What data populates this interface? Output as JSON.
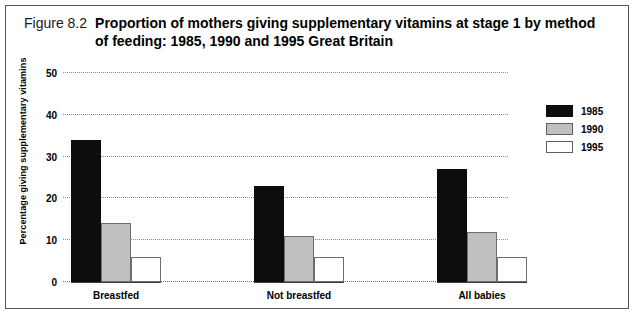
{
  "figure": {
    "number": "Figure 8.2",
    "title_line_1": "Proportion of mothers giving supplementary vitamins at stage 1 by method",
    "title_line_2": "of feeding: 1985, 1990 and 1995 Great Britain"
  },
  "colors": {
    "series_1985": "#0d0d0d",
    "series_1990": "#c0c0c0",
    "series_1995": "#ffffff",
    "gridline": "#8d8d8d",
    "axis": "#3d3d3d",
    "frame": "#555555"
  },
  "chart_data": {
    "type": "bar",
    "title": "Proportion of mothers giving supplementary vitamins at stage 1 by method of feeding: 1985, 1990 and 1995 Great Britain",
    "xlabel": "",
    "ylabel": "Percentage giving supplementary vitamins",
    "categories": [
      "Breastfed",
      "Not breastfed",
      "All babies"
    ],
    "series": [
      {
        "name": "1985",
        "values": [
          34,
          23,
          27
        ]
      },
      {
        "name": "1990",
        "values": [
          14,
          11,
          12
        ]
      },
      {
        "name": "1995",
        "values": [
          6,
          6,
          6
        ]
      }
    ],
    "ylim": [
      0,
      50
    ],
    "yticks": [
      0,
      10,
      20,
      30,
      40,
      50
    ],
    "ytick_labels": [
      "0",
      "10",
      "20",
      "30",
      "40",
      "50"
    ],
    "grid": true,
    "legend_position": "right"
  }
}
